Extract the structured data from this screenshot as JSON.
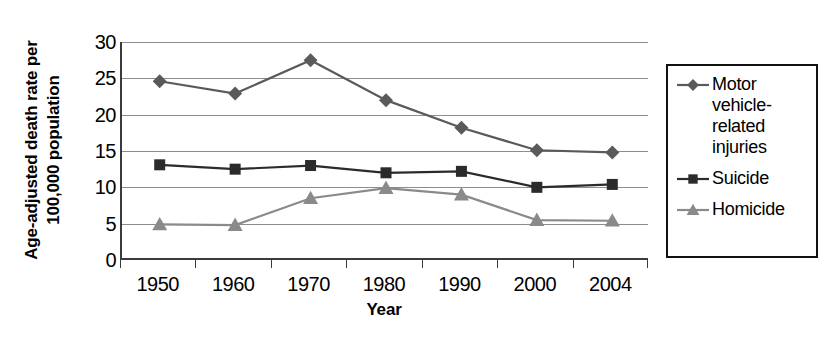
{
  "chart_data": {
    "type": "line",
    "title": "",
    "xlabel": "Year",
    "ylabel": "Age-adjusted death rate per 100,000 population",
    "ylabel_lines": [
      "Age-adjusted death rate per",
      "100,000 population"
    ],
    "categories": [
      "1950",
      "1960",
      "1970",
      "1980",
      "1990",
      "2000",
      "2004"
    ],
    "ylim": [
      0,
      30
    ],
    "ytick_labels": [
      "0",
      "5",
      "10",
      "15",
      "20",
      "25",
      "30"
    ],
    "ytick_values": [
      0,
      5,
      10,
      15,
      20,
      25,
      30
    ],
    "grid": true,
    "legend_position": "right",
    "series": [
      {
        "name": "Motor vehicle-related injuries",
        "marker": "diamond",
        "color": "#5a5a5a",
        "values": [
          24.6,
          22.9,
          27.5,
          22.0,
          18.2,
          15.1,
          14.8
        ]
      },
      {
        "name": "Suicide",
        "marker": "square",
        "color": "#2b2b2b",
        "values": [
          13.1,
          12.5,
          13.0,
          12.0,
          12.2,
          10.0,
          10.4
        ]
      },
      {
        "name": "Homicide",
        "marker": "triangle",
        "color": "#8a8a8a",
        "values": [
          4.9,
          4.8,
          8.5,
          9.9,
          9.0,
          5.5,
          5.4
        ]
      }
    ]
  },
  "legend": {
    "items": [
      {
        "label": "Motor vehicle-related injuries",
        "marker": "diamond",
        "color": "#5a5a5a"
      },
      {
        "label": "Suicide",
        "marker": "square",
        "color": "#2b2b2b"
      },
      {
        "label": "Homicide",
        "marker": "triangle",
        "color": "#8a8a8a"
      }
    ]
  },
  "axes": {
    "x_title": "Year",
    "y_title_line1": "Age-adjusted death rate per",
    "y_title_line2": "100,000 population"
  }
}
